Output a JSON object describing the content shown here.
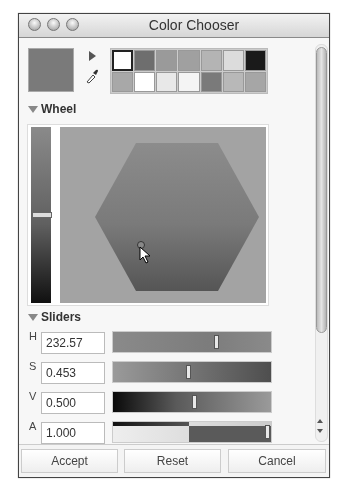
{
  "window": {
    "title": "Color Chooser",
    "traffic_lights": [
      "close",
      "minimize",
      "zoom"
    ]
  },
  "swatches": {
    "preview_color": "#7a7a7a",
    "colors": [
      [
        "#ffffff",
        "#6e6e6e",
        "#9a9a9a",
        "#a0a0a0",
        "#b4b4b4",
        "#dcdcdc",
        "#1a1a1a"
      ],
      [
        "#a8a8a8",
        "#ffffff",
        "#e8e8e8",
        "#f4f4f4",
        "#7a7a7a",
        "#b8b8b8",
        "#a6a6a6"
      ]
    ],
    "selected": [
      0,
      0
    ]
  },
  "sections": {
    "wheel": {
      "label": "Wheel",
      "expanded": true
    },
    "sliders": {
      "label": "Sliders",
      "expanded": true
    }
  },
  "sliders": [
    {
      "label": "H",
      "value": "232.57",
      "position": 0.64
    },
    {
      "label": "S",
      "value": "0.453",
      "position": 0.46
    },
    {
      "label": "V",
      "value": "0.500",
      "position": 0.5
    },
    {
      "label": "A",
      "value": "1.000",
      "position": 0.98
    }
  ],
  "buttons": {
    "accept": "Accept",
    "reset": "Reset",
    "cancel": "Cancel"
  }
}
